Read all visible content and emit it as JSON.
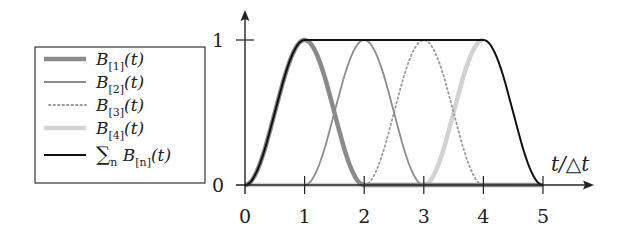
{
  "chart_data": {
    "type": "line",
    "title": "",
    "xlabel": "t/△t",
    "ylabel": "",
    "xlim": [
      0,
      5
    ],
    "ylim": [
      0,
      1
    ],
    "x_ticks": [
      "0",
      "1",
      "2",
      "3",
      "4",
      "5"
    ],
    "y_ticks": [
      "0",
      "1"
    ],
    "grid": false,
    "legend_position": "left",
    "series": [
      {
        "name": "B[1](t)",
        "label_main": "B",
        "label_sub": "[1]",
        "label_tail": "(t)",
        "style": "thick",
        "color": "#8a8a8a",
        "x": [
          0,
          0.25,
          0.5,
          0.75,
          1,
          1.25,
          1.5,
          1.75,
          2,
          3,
          4,
          5
        ],
        "values": [
          0,
          0.146,
          0.5,
          0.854,
          1,
          0.854,
          0.5,
          0.146,
          0,
          0,
          0,
          0
        ]
      },
      {
        "name": "B[2](t)",
        "label_main": "B",
        "label_sub": "[2]",
        "label_tail": "(t)",
        "style": "solid",
        "color": "#8c8c8c",
        "x": [
          1,
          1.25,
          1.5,
          1.75,
          2,
          2.25,
          2.5,
          2.75,
          3
        ],
        "values": [
          0,
          0.146,
          0.5,
          0.854,
          1,
          0.854,
          0.5,
          0.146,
          0
        ]
      },
      {
        "name": "B[3](t)",
        "label_main": "B",
        "label_sub": "[3]",
        "label_tail": "(t)",
        "style": "dotted",
        "color": "#9a9a9a",
        "x": [
          2,
          2.25,
          2.5,
          2.75,
          3,
          3.25,
          3.5,
          3.75,
          4,
          5
        ],
        "values": [
          0,
          0.146,
          0.5,
          0.854,
          1,
          0.854,
          0.5,
          0.146,
          0,
          0
        ]
      },
      {
        "name": "B[4](t)",
        "label_main": "B",
        "label_sub": "[4]",
        "label_tail": "(t)",
        "style": "thick-light",
        "color": "#d2d2d2",
        "x": [
          0,
          3,
          3.25,
          3.5,
          3.75,
          4
        ],
        "values": [
          0,
          0,
          0.146,
          0.5,
          0.854,
          1
        ]
      },
      {
        "name": "∑n B[n](t)",
        "label_main": "∑",
        "label_n": "n",
        "label_b": " B",
        "label_sub": "[n]",
        "label_tail": "(t)",
        "style": "solid-dark",
        "color": "#111111",
        "x": [
          0,
          0.25,
          0.5,
          0.75,
          1,
          2,
          3,
          4,
          4.25,
          4.5,
          4.75,
          5
        ],
        "values": [
          0,
          0.146,
          0.5,
          0.854,
          1,
          1,
          1,
          1,
          0.854,
          0.5,
          0.146,
          0
        ]
      }
    ]
  }
}
